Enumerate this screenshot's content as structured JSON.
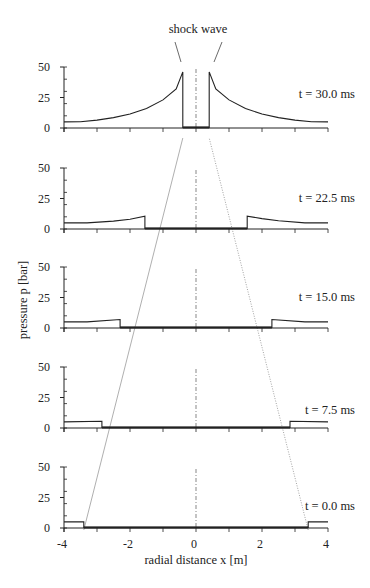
{
  "chart_data": {
    "type": "line",
    "title": "",
    "xlabel": "radial distance x [m]",
    "ylabel": "pressure p [bar]",
    "xlim": [
      -4,
      4
    ],
    "ylim": [
      0,
      50
    ],
    "x_ticks": [
      -4,
      -2,
      0,
      2,
      4
    ],
    "x_tick_labels": [
      "-4",
      "-2",
      "0",
      "2",
      "4"
    ],
    "y_ticks": [
      0,
      25,
      50
    ],
    "y_tick_labels": [
      "0",
      "25",
      "50"
    ],
    "grid": false,
    "legend": "none",
    "annotation": "shock wave",
    "panels": [
      {
        "time_label": "t = 30.0 ms",
        "shock_position_m": 0.4,
        "ambient_pressure_bar": 5,
        "inner_pressure_bar": 0.5,
        "peak_pressure_bar": 46,
        "profile": [
          [
            -4,
            5
          ],
          [
            -3.5,
            5.2
          ],
          [
            -3,
            6.5
          ],
          [
            -2.5,
            8.5
          ],
          [
            -2,
            11.5
          ],
          [
            -1.5,
            16
          ],
          [
            -1,
            23
          ],
          [
            -0.6,
            32
          ],
          [
            -0.4,
            46
          ],
          [
            -0.4,
            0.5
          ],
          [
            0.4,
            0.5
          ],
          [
            0.4,
            46
          ],
          [
            0.6,
            32
          ],
          [
            1,
            23
          ],
          [
            1.5,
            16
          ],
          [
            2,
            11.5
          ],
          [
            2.5,
            8.5
          ],
          [
            3,
            6.5
          ],
          [
            3.5,
            5.2
          ],
          [
            4,
            5
          ]
        ]
      },
      {
        "time_label": "t = 22.5 ms",
        "shock_position_m": 1.55,
        "ambient_pressure_bar": 5,
        "inner_pressure_bar": 0.5,
        "peak_pressure_bar": 10.5,
        "profile": [
          [
            -4,
            5
          ],
          [
            -3.3,
            5
          ],
          [
            -2.5,
            6.5
          ],
          [
            -2,
            8
          ],
          [
            -1.55,
            10.5
          ],
          [
            -1.55,
            0.5
          ],
          [
            1.55,
            0.5
          ],
          [
            1.55,
            10.5
          ],
          [
            2,
            8.5
          ],
          [
            2.5,
            6.8
          ],
          [
            3.3,
            5
          ],
          [
            4,
            5
          ]
        ]
      },
      {
        "time_label": "t = 15.0 ms",
        "shock_position_m": 2.3,
        "ambient_pressure_bar": 5,
        "inner_pressure_bar": 0.5,
        "peak_pressure_bar": 7,
        "profile": [
          [
            -4,
            5
          ],
          [
            -3.3,
            5
          ],
          [
            -2.3,
            7
          ],
          [
            -2.3,
            0.5
          ],
          [
            2.3,
            0.5
          ],
          [
            2.3,
            7
          ],
          [
            3.3,
            5
          ],
          [
            4,
            5
          ]
        ]
      },
      {
        "time_label": "t = 7.5 ms",
        "shock_position_m": 2.85,
        "ambient_pressure_bar": 5,
        "inner_pressure_bar": 0.5,
        "peak_pressure_bar": 5.5,
        "profile": [
          [
            -4,
            5
          ],
          [
            -2.85,
            5.5
          ],
          [
            -2.85,
            0.5
          ],
          [
            2.85,
            0.5
          ],
          [
            2.85,
            5.5
          ],
          [
            4,
            5
          ]
        ]
      },
      {
        "time_label": "t = 0.0 ms",
        "shock_position_m": 3.4,
        "ambient_pressure_bar": 5,
        "inner_pressure_bar": 0.5,
        "peak_pressure_bar": 5,
        "profile": [
          [
            -4,
            5
          ],
          [
            -3.4,
            5
          ],
          [
            -3.4,
            0.5
          ],
          [
            3.4,
            0.5
          ],
          [
            3.4,
            5
          ],
          [
            4,
            5
          ]
        ]
      }
    ]
  },
  "labels": {
    "annotation": "shock wave",
    "xlabel": "radial distance x [m]",
    "ylabel": "pressure p [bar]"
  }
}
